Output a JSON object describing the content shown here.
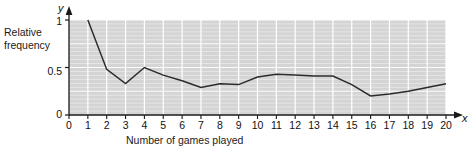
{
  "figure": {
    "y_axis_variable": "y",
    "x_axis_variable": "x",
    "y_caption": "Relative\nfrequency",
    "x_caption": "Number of games played",
    "plot_bg_color": "#d4d4d4",
    "gridline_color": "#ffffff",
    "line_color": "#2b2b2b",
    "axis_color": "#1a1a1a",
    "text_color": "#111111"
  },
  "chart_data": {
    "type": "line",
    "title": "",
    "xlabel": "Number of games played",
    "ylabel": "Relative frequency",
    "xlim": [
      0,
      20
    ],
    "ylim": [
      0,
      1
    ],
    "grid": true,
    "legend": "none",
    "x_ticks": [
      0,
      1,
      2,
      3,
      4,
      5,
      6,
      7,
      8,
      9,
      10,
      11,
      12,
      13,
      14,
      15,
      16,
      17,
      18,
      19,
      20
    ],
    "x_tick_labels": [
      "0",
      "1",
      "2",
      "3",
      "4",
      "5",
      "6",
      "7",
      "8",
      "9",
      "10",
      "11",
      "12",
      "13",
      "14",
      "15",
      "16",
      "17",
      "18",
      "19",
      "20"
    ],
    "y_ticks": [
      0,
      0.5,
      1
    ],
    "y_tick_labels": [
      "0",
      "0.5",
      "1"
    ],
    "x": [
      1,
      2,
      3,
      4,
      5,
      6,
      7,
      8,
      9,
      10,
      11,
      12,
      13,
      14,
      15,
      16,
      17,
      18,
      19,
      20
    ],
    "values": [
      1.0,
      0.48,
      0.33,
      0.5,
      0.42,
      0.36,
      0.29,
      0.33,
      0.32,
      0.4,
      0.43,
      0.42,
      0.41,
      0.41,
      0.32,
      0.2,
      0.22,
      0.25,
      0.29,
      0.33
    ],
    "series": [
      {
        "name": "Relative frequency",
        "values": [
          1.0,
          0.48,
          0.33,
          0.5,
          0.42,
          0.36,
          0.29,
          0.33,
          0.32,
          0.4,
          0.43,
          0.42,
          0.41,
          0.41,
          0.32,
          0.2,
          0.22,
          0.25,
          0.29,
          0.33
        ]
      }
    ]
  }
}
